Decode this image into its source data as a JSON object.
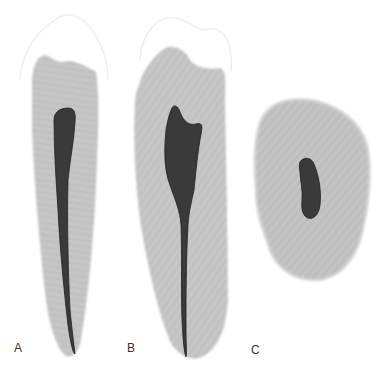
{
  "figure": {
    "panels": [
      {
        "id": "A",
        "label": "A",
        "view": "longitudinal section, straight canal"
      },
      {
        "id": "B",
        "label": "B",
        "view": "longitudinal section, flared pulp chamber"
      },
      {
        "id": "C",
        "label": "C",
        "view": "cross section"
      }
    ],
    "colors": {
      "dentin": "#bdbdbd",
      "dentin_edge": "#d6d6d6",
      "enamel_outline": "#ececec",
      "pulp": "#3a3a3a",
      "pulp_edge": "#1f1f1f",
      "background": "#ffffff"
    }
  }
}
